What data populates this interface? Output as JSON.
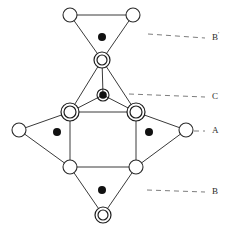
{
  "figure": {
    "title": "",
    "width": 234,
    "height": 230,
    "background": "#ffffff",
    "edge_color": "#3a3a3a",
    "leader_color": "#7d7d7d",
    "node_stroke": "#1d1d1d",
    "dot_color": "#111111"
  },
  "labels": [
    {
      "id": "label-b-prime",
      "text": "B",
      "prime": "'",
      "x": 212,
      "y": 38,
      "leader": {
        "x1": 148,
        "y1": 34,
        "x2": 205,
        "y2": 38
      }
    },
    {
      "id": "label-c",
      "text": "C",
      "prime": "",
      "x": 212,
      "y": 97,
      "leader": {
        "x1": 129,
        "y1": 94,
        "x2": 205,
        "y2": 97
      }
    },
    {
      "id": "label-a",
      "text": "A",
      "prime": "",
      "x": 212,
      "y": 131,
      "leader": {
        "x1": 194,
        "y1": 131,
        "x2": 205,
        "y2": 131
      }
    },
    {
      "id": "label-b",
      "text": "B",
      "prime": "",
      "x": 212,
      "y": 192,
      "leader": {
        "x1": 147,
        "y1": 190,
        "x2": 205,
        "y2": 192
      }
    }
  ],
  "nodes": [
    {
      "id": "n-top-left",
      "kind": "open",
      "x": 70,
      "y": 15,
      "r": 7
    },
    {
      "id": "n-top-right",
      "kind": "open",
      "x": 133,
      "y": 15,
      "r": 7
    },
    {
      "id": "n-upper-apex",
      "kind": "double",
      "x": 102,
      "y": 60,
      "r": 8
    },
    {
      "id": "n-mid-left",
      "kind": "double",
      "x": 70,
      "y": 112,
      "r": 9
    },
    {
      "id": "n-mid-right",
      "kind": "double",
      "x": 136,
      "y": 112,
      "r": 9
    },
    {
      "id": "n-far-left",
      "kind": "open",
      "x": 19,
      "y": 130,
      "r": 7
    },
    {
      "id": "n-far-right",
      "kind": "open",
      "x": 186,
      "y": 130,
      "r": 7
    },
    {
      "id": "n-low-left",
      "kind": "open",
      "x": 70,
      "y": 167,
      "r": 7
    },
    {
      "id": "n-low-right",
      "kind": "open",
      "x": 136,
      "y": 167,
      "r": 7
    },
    {
      "id": "n-bottom-apex",
      "kind": "double",
      "x": 103,
      "y": 215,
      "r": 8
    },
    {
      "id": "n-center",
      "kind": "dotring",
      "x": 103,
      "y": 95,
      "r": 6
    }
  ],
  "edges": [
    {
      "id": "e-top-top",
      "from": "n-top-left",
      "to": "n-top-right"
    },
    {
      "id": "e-topleft-apex",
      "from": "n-top-left",
      "to": "n-upper-apex"
    },
    {
      "id": "e-topright-apex",
      "from": "n-top-right",
      "to": "n-upper-apex"
    },
    {
      "id": "e-apex-midleft",
      "from": "n-upper-apex",
      "to": "n-mid-left"
    },
    {
      "id": "e-apex-midright",
      "from": "n-upper-apex",
      "to": "n-mid-right"
    },
    {
      "id": "e-apex-center",
      "from": "n-upper-apex",
      "to": "n-center"
    },
    {
      "id": "e-center-midleft",
      "from": "n-center",
      "to": "n-mid-left"
    },
    {
      "id": "e-center-midright",
      "from": "n-center",
      "to": "n-mid-right"
    },
    {
      "id": "e-mid-top",
      "from": "n-mid-left",
      "to": "n-mid-right"
    },
    {
      "id": "e-midleft-farleft",
      "from": "n-mid-left",
      "to": "n-far-left"
    },
    {
      "id": "e-midright-farright",
      "from": "n-mid-right",
      "to": "n-far-right"
    },
    {
      "id": "e-midleft-lowleft",
      "from": "n-mid-left",
      "to": "n-low-left"
    },
    {
      "id": "e-midright-lowright",
      "from": "n-mid-right",
      "to": "n-low-right"
    },
    {
      "id": "e-farleft-lowleft",
      "from": "n-far-left",
      "to": "n-low-left"
    },
    {
      "id": "e-farright-lowright",
      "from": "n-far-right",
      "to": "n-low-right"
    },
    {
      "id": "e-low-bottom",
      "from": "n-low-left",
      "to": "n-low-right"
    },
    {
      "id": "e-lowleft-apex",
      "from": "n-low-left",
      "to": "n-bottom-apex"
    },
    {
      "id": "e-lowright-apex",
      "from": "n-low-right",
      "to": "n-bottom-apex"
    }
  ],
  "face_dots": [
    {
      "id": "dot-b-prime",
      "x": 102,
      "y": 37,
      "r": 4
    },
    {
      "id": "dot-left",
      "x": 57,
      "y": 132,
      "r": 4
    },
    {
      "id": "dot-right",
      "x": 149,
      "y": 132,
      "r": 4
    },
    {
      "id": "dot-b",
      "x": 102,
      "y": 190,
      "r": 4
    }
  ]
}
